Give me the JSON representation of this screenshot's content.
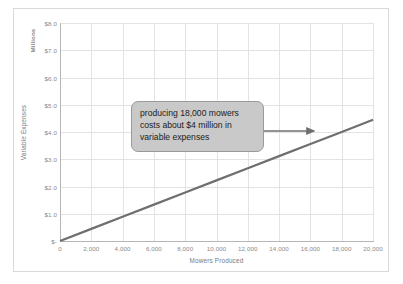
{
  "chart_data": {
    "type": "line",
    "title": "",
    "xlabel": "Mowers Produced",
    "ylabel": "Variable Expenses",
    "units_label": "Millions",
    "x": [
      0,
      20000
    ],
    "values": [
      0,
      4.45
    ],
    "series": [
      {
        "name": "Variable Expenses",
        "x": [
          0,
          2000,
          4000,
          6000,
          8000,
          10000,
          12000,
          14000,
          16000,
          18000,
          20000
        ],
        "values": [
          0,
          0.445,
          0.89,
          1.335,
          1.78,
          2.225,
          2.67,
          3.115,
          3.56,
          4.0,
          4.45
        ],
        "color": "#6f6f6f"
      }
    ],
    "xlim": [
      0,
      20000
    ],
    "ylim": [
      0,
      8.0
    ],
    "xticks": [
      "0",
      "2,000",
      "4,000",
      "6,000",
      "8,000",
      "10,000",
      "12,000",
      "14,000",
      "16,000",
      "18,000",
      "20,000"
    ],
    "xtick_values": [
      0,
      2000,
      4000,
      6000,
      8000,
      10000,
      12000,
      14000,
      16000,
      18000,
      20000
    ],
    "yticks": [
      "$-",
      "$1.0",
      "$2.0",
      "$3.0",
      "$4.0",
      "$5.0",
      "$6.0",
      "$7.0",
      "$8.0"
    ],
    "ytick_values": [
      0,
      1,
      2,
      3,
      4,
      5,
      6,
      7,
      8
    ],
    "grid": true,
    "legend": "none",
    "annotations": [
      {
        "text": "producing 18,000 mowers costs about $4 million in variable expenses",
        "points_to_x": 18000,
        "points_to_y": 4.0
      }
    ]
  },
  "colors": {
    "series_line": "#6f6f6f",
    "gridline": "#e3e3e3",
    "axis_line": "#b6b6b6",
    "tick_text": "#8a8a8a",
    "axis_title": "#7a7a7a",
    "callout_fill": "#c9c9c9",
    "callout_border": "#9a9a9a",
    "frame_border": "#d9d9d9",
    "background": "#ffffff"
  }
}
